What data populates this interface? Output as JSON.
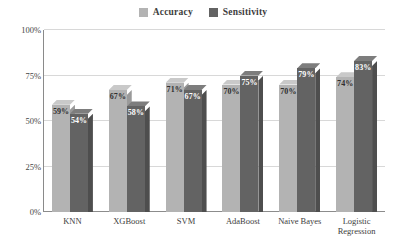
{
  "chart_data": {
    "type": "bar",
    "title": "",
    "subtitle": "",
    "xlabel": "",
    "ylabel": "",
    "ylim": [
      0,
      100
    ],
    "yticks": [
      "0%",
      "25%",
      "50%",
      "75%",
      "100%"
    ],
    "ytick_values": [
      0,
      25,
      50,
      75,
      100
    ],
    "grid": true,
    "legend_position": "top-center",
    "value_suffix": "%",
    "categories": [
      "KNN",
      "XGBoost",
      "SVM",
      "AdaBoost",
      "Naive Bayes",
      "Logistic Regression"
    ],
    "series": [
      {
        "name": "Accuracy",
        "color": "#b3b3b3",
        "top_color": "#c9c9c9",
        "side_color": "#9a9a9a",
        "label_color": "#2f2f2f",
        "values": [
          59,
          67,
          71,
          70,
          70,
          74
        ],
        "labels": [
          "59%",
          "67%",
          "71%",
          "70%",
          "70%",
          "74%"
        ]
      },
      {
        "name": "Sensitivity",
        "color": "#636363",
        "top_color": "#7d7d7d",
        "side_color": "#4e4e4e",
        "label_color": "#ffffff",
        "values": [
          54,
          58,
          67,
          75,
          79,
          83
        ],
        "labels": [
          "54%",
          "58%",
          "67%",
          "75%",
          "79%",
          "83%"
        ]
      }
    ]
  },
  "legend": {
    "entries": [
      {
        "label": "Accuracy",
        "color": "#b3b3b3"
      },
      {
        "label": "Sensitivity",
        "color": "#636363"
      }
    ]
  },
  "colors": {
    "background": "#ffffff",
    "gridline": "#d8d8d8",
    "axis": "#8a8a8a",
    "text": "#3d3d3d"
  }
}
